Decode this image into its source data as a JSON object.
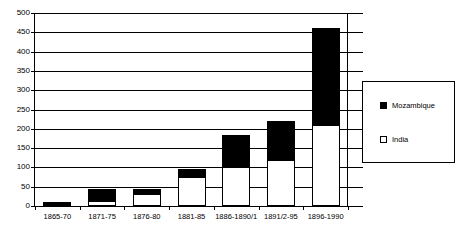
{
  "chart_data": {
    "type": "bar",
    "subtype": "stacked-bar",
    "title": "",
    "xlabel": "",
    "ylabel": "",
    "ylim": [
      0,
      500
    ],
    "ytick_step": 50,
    "yticks": [
      0,
      50,
      100,
      150,
      200,
      250,
      300,
      350,
      400,
      450,
      500
    ],
    "ytick_labels": [
      "0",
      "50",
      "100",
      "150",
      "200",
      "250",
      "300",
      "350",
      "400",
      "450",
      "500"
    ],
    "grid": true,
    "grid_axis": "y",
    "legend_position": "right",
    "categories": [
      "1865-70",
      "1871-75",
      "1876-80",
      "1881-85",
      "1886-1890/1",
      "1891/2-95",
      "1896-1990"
    ],
    "series": [
      {
        "name": "India",
        "color": "#ffffff",
        "edge_color": "#000000",
        "stack_order": 0,
        "values": [
          2,
          13,
          30,
          75,
          100,
          120,
          210
        ]
      },
      {
        "name": "Mozambique",
        "color": "#000000",
        "edge_color": "#000000",
        "stack_order": 1,
        "values": [
          8,
          32,
          15,
          20,
          85,
          100,
          250
        ]
      }
    ],
    "totals": [
      10,
      45,
      45,
      95,
      185,
      220,
      460
    ]
  },
  "legend": {
    "items": [
      {
        "label": "Mozambique",
        "swatch": "#000000"
      },
      {
        "label": "India",
        "swatch": "#ffffff"
      }
    ]
  }
}
